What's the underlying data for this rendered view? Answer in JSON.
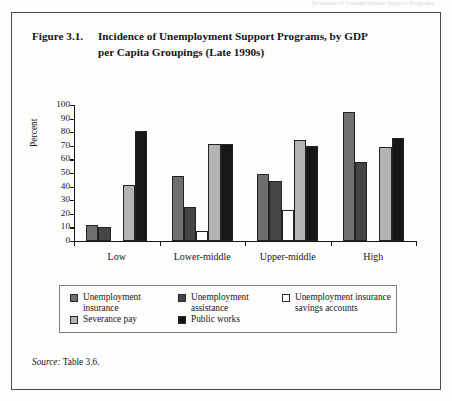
{
  "running_head": "Incidence of Unemployment Support Programs",
  "figure": {
    "number": "Figure 3.1.",
    "title_line1": "Incidence of Unemployment Support Programs, by GDP",
    "title_line2": "per Capita Groupings (Late 1990s)"
  },
  "source": {
    "label": "Source:",
    "text": " Table 3.6."
  },
  "legend": {
    "items": [
      {
        "label": "Unemployment\ninsurance",
        "color": "#6f6f6f"
      },
      {
        "label": "Unemployment\nassistance",
        "color": "#454545"
      },
      {
        "label": "Unemployment insurance\nsavings accounts",
        "color": "#ffffff"
      },
      {
        "label": "Severance pay",
        "color": "#b4b4b4"
      },
      {
        "label": "Public works",
        "color": "#171717"
      }
    ]
  },
  "chart_data": {
    "type": "bar",
    "title": "Incidence of Unemployment Support Programs, by GDP per Capita Groupings (Late 1990s)",
    "xlabel": "",
    "ylabel": "Percent",
    "ylim": [
      0,
      100
    ],
    "yticks": [
      0,
      10,
      20,
      30,
      40,
      50,
      60,
      70,
      80,
      90,
      100
    ],
    "ytick_labels": [
      "0",
      "10",
      "20",
      "30",
      "40",
      "50",
      "60",
      "70",
      "80",
      "90",
      "100"
    ],
    "grid": false,
    "legend_position": "below",
    "categories": [
      "Low",
      "Lower-middle",
      "Upper-middle",
      "High"
    ],
    "series": [
      {
        "name": "Unemployment insurance",
        "color": "#6f6f6f",
        "values": [
          12,
          48,
          49,
          95
        ]
      },
      {
        "name": "Unemployment assistance",
        "color": "#454545",
        "values": [
          10,
          25,
          44,
          58
        ]
      },
      {
        "name": "Unemployment insurance savings accounts",
        "color": "#ffffff",
        "values": [
          0,
          7,
          23,
          0
        ]
      },
      {
        "name": "Severance pay",
        "color": "#b4b4b4",
        "values": [
          41,
          71,
          74,
          69
        ]
      },
      {
        "name": "Public works",
        "color": "#171717",
        "values": [
          81,
          71,
          70,
          76
        ]
      }
    ]
  }
}
